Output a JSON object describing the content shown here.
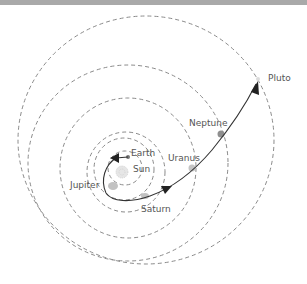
{
  "diagram": {
    "labels": {
      "earth": "Earth",
      "sun": "Sun",
      "jupiter": "Jupiter",
      "saturn": "Saturn",
      "uranus": "Uranus",
      "neptune": "Neptune",
      "pluto": "Pluto"
    },
    "colors": {
      "orbit": "#8a8a8a",
      "trajectory": "#333333",
      "planet": "#b5b5b5",
      "neptune": "#888888",
      "label": "#555555",
      "topbar": "#a9a9a9"
    }
  }
}
